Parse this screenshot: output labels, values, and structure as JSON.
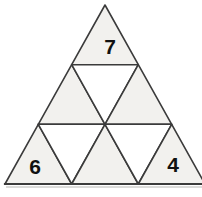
{
  "figure": {
    "type": "subdivided-triangle",
    "rows": 3,
    "small_triangle_count": 9,
    "labels": {
      "top": "7",
      "bottom_left": "6",
      "bottom_right": "4"
    },
    "colors": {
      "background": "#ffffff",
      "up_fill": "#f2f1ee",
      "down_fill": "#ffffff",
      "line": "#3b3b3b",
      "base_shadow": "#cfcfcc",
      "text": "#111111"
    }
  }
}
